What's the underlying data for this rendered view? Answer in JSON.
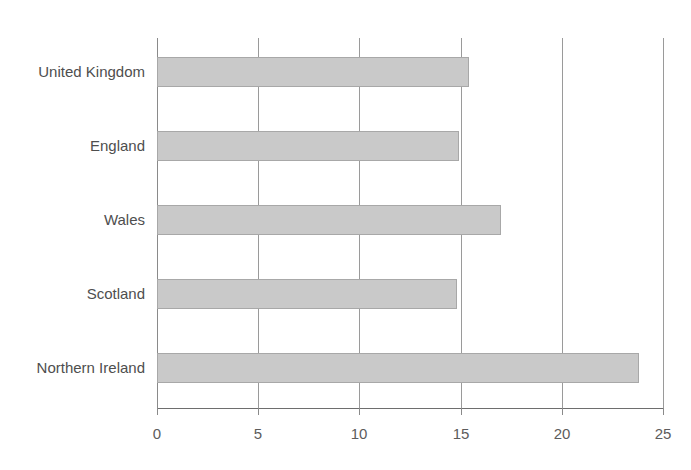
{
  "title_remnant": "g",
  "colors": {
    "bar_fill": "#c9c9c9",
    "bar_border": "#a8a8a8",
    "gridline": "#9a9a9a",
    "axis": "#6e6e6e",
    "text": "#4e4e4e",
    "background": "#ffffff"
  },
  "chart_data": {
    "type": "bar",
    "orientation": "horizontal",
    "title": "",
    "xlabel": "",
    "ylabel": "",
    "categories": [
      "United Kingdom",
      "England",
      "Wales",
      "Scotland",
      "Northern Ireland"
    ],
    "values": [
      15.4,
      14.9,
      17.0,
      14.8,
      23.8
    ],
    "xlim": [
      0,
      25
    ],
    "xticks": [
      0,
      5,
      10,
      15,
      20,
      25
    ],
    "xtick_labels": [
      "0",
      "5",
      "10",
      "15",
      "20",
      "25"
    ],
    "grid": "vertical",
    "legend": "none"
  }
}
